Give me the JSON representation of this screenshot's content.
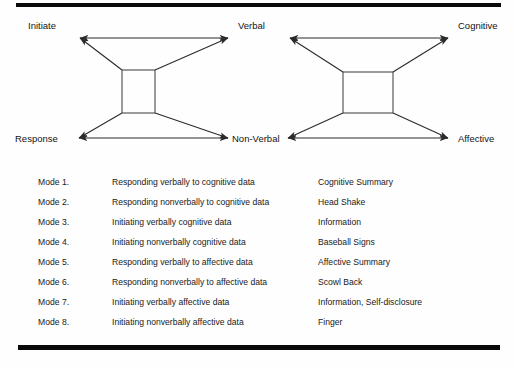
{
  "figure": {
    "diagrams": [
      {
        "name": "initiate-response-verbal-nonverbal",
        "top_left_label": "Initiate",
        "bottom_left_label": "Response",
        "top_right_label": "Verbal",
        "bottom_right_label": "Non-Verbal"
      },
      {
        "name": "verbal-nonverbal-cognitive-affective",
        "top_left_label": "Verbal",
        "bottom_left_label": "Non-Verbal",
        "top_right_label": "Cognitive",
        "bottom_right_label": "Affective"
      }
    ]
  },
  "mode_list": {
    "columns": [
      "Mode",
      "Description",
      "Example"
    ],
    "rows": [
      {
        "mode": "Mode 1.",
        "description": "Responding verbally to cognitive data",
        "example": "Cognitive Summary"
      },
      {
        "mode": "Mode 2.",
        "description": "Responding nonverbally to cognitive data",
        "example": "Head Shake"
      },
      {
        "mode": "Mode 3.",
        "description": "Initiating verbally cognitive data",
        "example": "Information"
      },
      {
        "mode": "Mode 4.",
        "description": "Initiating nonverbally cognitive data",
        "example": "Baseball Signs"
      },
      {
        "mode": "Mode 5.",
        "description": "Responding verbally to affective data",
        "example": "Affective Summary"
      },
      {
        "mode": "Mode 6.",
        "description": "Responding nonverbally to affective data",
        "example": "Scowl Back"
      },
      {
        "mode": "Mode 7.",
        "description": "Initiating verbally affective data",
        "example": "Information, Self-disclosure"
      },
      {
        "mode": "Mode 8.",
        "description": "Initiating nonverbally affective data",
        "example": "Finger"
      }
    ]
  },
  "colors": {
    "rule": "#090909",
    "line": "#2b2b2b",
    "box": "#4a4a4a",
    "text": "#141414",
    "background": "#fefefe"
  }
}
